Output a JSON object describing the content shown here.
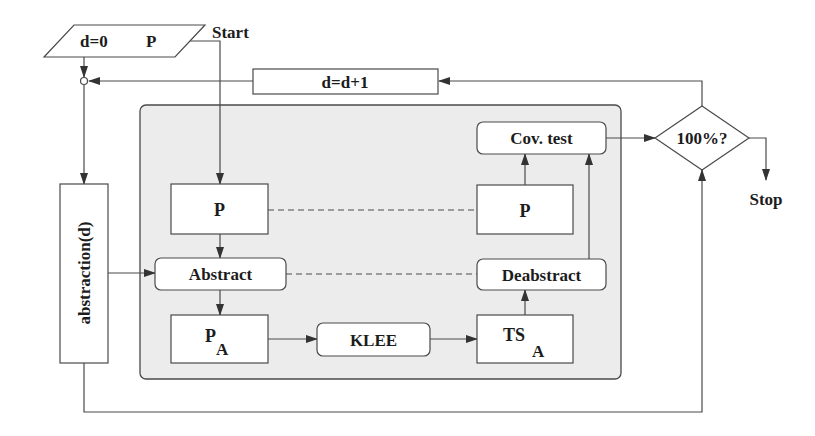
{
  "diagram": {
    "colors": {
      "stroke": "#4a4a4a",
      "container_fill": "#ececec",
      "box_fill": "#ffffff",
      "text": "#1c1c1c"
    },
    "input": {
      "left": "d=0",
      "right": "P"
    },
    "start_label": "Start",
    "increment": {
      "label": "d=d+1"
    },
    "abstraction": {
      "label": "abstraction(d)"
    },
    "left_column": {
      "program": {
        "label": "P"
      },
      "abstract": {
        "label": "Abstract"
      },
      "abstract_program": {
        "label": "P",
        "subscript": "A"
      }
    },
    "klee": {
      "label": "KLEE"
    },
    "right_column": {
      "cov_test": {
        "label": "Cov. test"
      },
      "program": {
        "label": "P"
      },
      "deabstract": {
        "label": "Deabstract"
      },
      "test_suite": {
        "label": "TS",
        "subscript": "A"
      }
    },
    "decision": {
      "label": "100%?"
    },
    "stop_label": "Stop"
  }
}
